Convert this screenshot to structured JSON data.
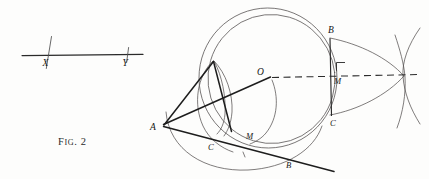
{
  "figure": {
    "caption_prefix": "F",
    "caption_rest": "IG",
    "caption_suffix": ". 2",
    "caption_full": "Fig. 2",
    "background_color": "#fdfdfc",
    "ink_color": "#1d1d1d",
    "light_ink_color": "#555151"
  },
  "left_panel": {
    "name": "straight-line-with-two-marked-points",
    "line": {
      "x1": 22,
      "y1": 55,
      "x2": 143,
      "y2": 55
    },
    "points": [
      {
        "label": "X",
        "x": 48,
        "y": 55,
        "label_x": 43,
        "label_y": 65
      },
      {
        "label": "Y",
        "x": 127,
        "y": 55,
        "label_x": 124,
        "label_y": 65
      }
    ],
    "tick_marks": [
      {
        "x1": 51,
        "y1": 36,
        "x2": 46,
        "y2": 68
      },
      {
        "x1": 128,
        "y1": 47,
        "x2": 127,
        "y2": 62
      }
    ]
  },
  "right_panel": {
    "name": "circle-construction-with-tangent-and-chords",
    "center_label": "O",
    "circles": [
      {
        "name": "outer-circle",
        "cx": 268,
        "cy": 78,
        "r": 68,
        "rotate": -8
      },
      {
        "name": "inner-circle",
        "cx": 270,
        "cy": 79,
        "r": 63,
        "rotate": -8
      }
    ],
    "labels": [
      {
        "text": "O",
        "x": 258,
        "y": 73,
        "point": "center"
      },
      {
        "text": "A",
        "x": 152,
        "y": 128,
        "point": "external-point-left"
      },
      {
        "text": "B",
        "x": 331,
        "y": 32,
        "point": "upper-right-B"
      },
      {
        "text": "M",
        "x": 337,
        "y": 80,
        "point": "right-midpoint-M"
      },
      {
        "text": "C",
        "x": 333,
        "y": 120,
        "point": "lower-right-C"
      },
      {
        "text": "C",
        "x": 211,
        "y": 146,
        "point": "lower-left-C"
      },
      {
        "text": "M",
        "x": 249,
        "y": 136,
        "point": "lower-M"
      },
      {
        "text": "B",
        "x": 288,
        "y": 164,
        "point": "lower-B"
      }
    ],
    "dashed_line": {
      "x1": 271,
      "y1": 77,
      "x2": 420,
      "y2": 74,
      "name": "axis-dashed-line"
    },
    "right_angle_marker": {
      "x": 336,
      "y": 62,
      "size": 8
    },
    "chords": [
      {
        "name": "chord-B-C-right",
        "x1": 331,
        "y1": 39,
        "x2": 331,
        "y2": 115
      },
      {
        "name": "line-A-to-O",
        "x1": 163,
        "y1": 125,
        "x2": 271,
        "y2": 77
      },
      {
        "name": "line-A-through-C-M-B",
        "x1": 163,
        "y1": 126,
        "x2": 333,
        "y2": 172
      },
      {
        "name": "line-A-to-lens-top",
        "x1": 163,
        "y1": 125,
        "x2": 214,
        "y2": 62
      },
      {
        "name": "line-lens-top-to-lens-bottom",
        "x1": 214,
        "y1": 62,
        "x2": 232,
        "y2": 131
      }
    ]
  }
}
